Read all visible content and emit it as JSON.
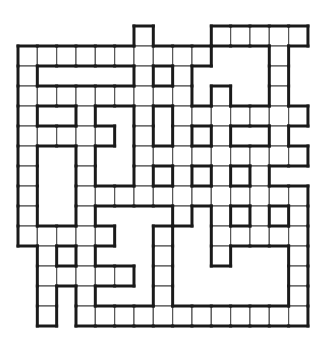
{
  "puzzle": {
    "type": "crossword-grid",
    "cols": 15,
    "rows": 15,
    "row_labels_note": "row 0 is top extension row",
    "cells_by_row": [
      [
        6,
        10,
        11,
        12,
        13,
        14
      ],
      [
        0,
        1,
        2,
        3,
        4,
        5,
        6,
        7,
        8,
        9,
        13
      ],
      [
        0,
        6,
        8,
        13
      ],
      [
        0,
        1,
        2,
        3,
        4,
        5,
        6,
        7,
        8,
        10,
        13
      ],
      [
        0,
        3,
        6,
        8,
        9,
        10,
        11,
        12,
        13,
        14
      ],
      [
        0,
        1,
        2,
        3,
        4,
        6,
        8,
        10,
        13
      ],
      [
        0,
        3,
        6,
        7,
        8,
        9,
        10,
        11,
        12,
        13,
        14
      ],
      [
        0,
        3,
        6,
        8,
        10,
        12
      ],
      [
        0,
        3,
        4,
        5,
        6,
        7,
        8,
        9,
        10,
        11,
        12,
        13,
        14
      ],
      [
        0,
        3,
        8,
        10,
        12,
        14
      ],
      [
        0,
        1,
        2,
        3,
        4,
        7,
        10,
        11,
        12,
        13,
        14
      ],
      [
        1,
        3,
        7,
        10,
        14
      ],
      [
        1,
        2,
        3,
        4,
        5,
        7,
        14
      ],
      [
        1,
        3,
        7,
        14
      ],
      [
        1,
        3,
        4,
        5,
        6,
        7,
        8,
        9,
        10,
        11,
        12,
        13,
        14
      ]
    ],
    "colors": {
      "background": "#ffffff",
      "cell_fill": "#ffffff",
      "grid_line": "#555555",
      "border": "#1a1a1a"
    }
  }
}
